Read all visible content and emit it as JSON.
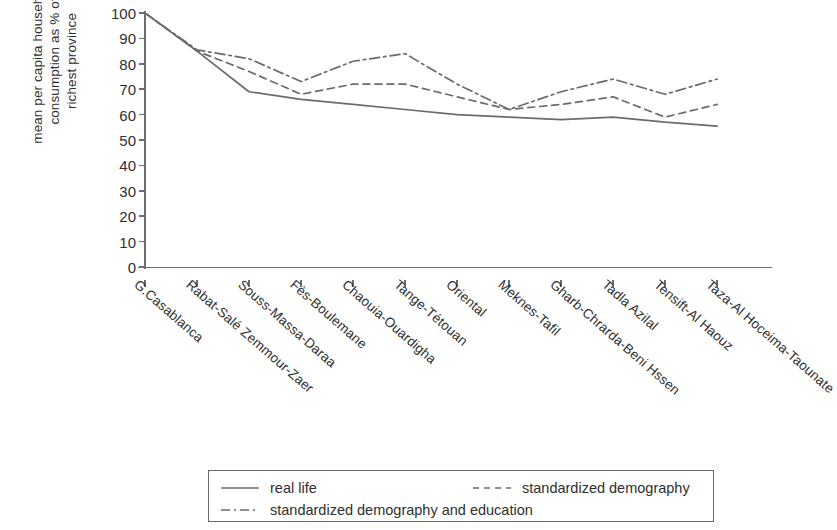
{
  "chart_data": {
    "type": "line",
    "title": "",
    "xlabel": "",
    "ylabel": "mean per capita household consumption as % of richest province",
    "ylabel_lines": [
      "mean per capita household",
      "consumption as % of",
      "richest province"
    ],
    "ylim": [
      0,
      100
    ],
    "yticks": [
      0,
      10,
      20,
      30,
      40,
      50,
      60,
      70,
      80,
      90,
      100
    ],
    "grid": false,
    "legend_position": "bottom",
    "categories": [
      "G.Casablanca",
      "Rabat-Salé Zemmour-Zaer",
      "Souss-Massa-Daraa",
      "Fès-Boulemane",
      "Chaouia-Ouardigha",
      "Tange-Tétouan",
      "Oriental",
      "Meknes-Tafil",
      "Gharb-Chrarda-Beni Hssen",
      "Tadla Azilal",
      "Tensift-Al Haouz",
      "Taza-Al Hoceima-Taounate"
    ],
    "series": [
      {
        "name": "real life",
        "style": "solid",
        "color": "#6b6b6b",
        "values": [
          100,
          85,
          69,
          66,
          64,
          62,
          60,
          59,
          58,
          59,
          57,
          55.5
        ]
      },
      {
        "name": "standardized demography",
        "style": "dashed",
        "color": "#6b6b6b",
        "values": [
          100,
          85,
          77,
          68,
          72,
          72,
          67,
          62,
          64,
          67,
          59,
          64
        ]
      },
      {
        "name": "standardized demography and education",
        "style": "dashdot",
        "color": "#6b6b6b",
        "values": [
          100,
          85.5,
          82,
          73,
          81,
          84,
          72,
          62,
          69,
          74,
          68,
          74
        ]
      }
    ]
  },
  "legend": {
    "entries": [
      {
        "label": "real life",
        "style": "solid"
      },
      {
        "label": "standardized demography",
        "style": "dashed"
      },
      {
        "label": "standardized demography and education",
        "style": "dashdot"
      }
    ]
  }
}
